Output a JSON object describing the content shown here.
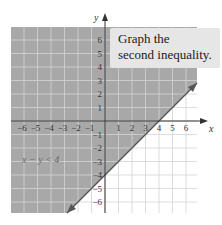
{
  "callout": {
    "line1": "Graph the",
    "line2": "second inequality."
  },
  "axes": {
    "x_label": "x",
    "y_label": "y",
    "x_ticks_neg": [
      "-6",
      "-5",
      "-4",
      "-3",
      "-2",
      "-1"
    ],
    "x_ticks_pos": [
      "1",
      "2",
      "3",
      "4",
      "5",
      "6"
    ],
    "y_ticks_pos": [
      "1",
      "2",
      "3",
      "4",
      "5",
      "6"
    ],
    "y_ticks_neg": [
      "-1",
      "-2",
      "-3",
      "-4",
      "-5",
      "-6"
    ]
  },
  "region_label": "x − y < 4",
  "colors": {
    "shade": "#a8a8a8",
    "grid_shaded": "#c2c2c2",
    "grid_unshaded": "#d4d4d4",
    "axis": "#333333",
    "boundary": "#555555",
    "callout_bg": "#e6e6e6"
  },
  "chart_data": {
    "type": "line",
    "title": "Graph the second inequality.",
    "xlabel": "x",
    "ylabel": "y",
    "xlim": [
      -7,
      6.8
    ],
    "ylim": [
      -6.8,
      6.9
    ],
    "grid": true,
    "boundary_line": {
      "equation": "x - y = 4",
      "style": "solid",
      "points": [
        [
          -2.8,
          -6.8
        ],
        [
          0,
          -4
        ],
        [
          4,
          0
        ],
        [
          6.8,
          2.8
        ]
      ]
    },
    "shaded_region": {
      "inequality": "x - y < 4",
      "side": "above-left of line"
    },
    "annotations": [
      {
        "text": "x − y < 4",
        "x": -4,
        "y": -3
      },
      {
        "text": "Graph the second inequality.",
        "position": "top-right callout"
      }
    ],
    "x_ticks": [
      -6,
      -5,
      -4,
      -3,
      -2,
      -1,
      1,
      2,
      3,
      4,
      5,
      6
    ],
    "y_ticks": [
      -6,
      -5,
      -4,
      -3,
      -2,
      -1,
      1,
      2,
      3,
      4,
      5,
      6
    ]
  }
}
